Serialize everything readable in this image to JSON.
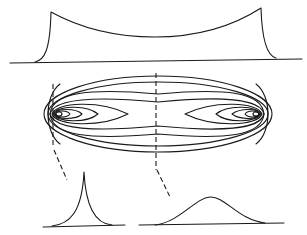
{
  "diagram": {
    "type": "contour-with-profiles",
    "colors": {
      "ink": "#1a1a1a",
      "background": "#ffffff"
    },
    "panels": [
      {
        "id": "top-profile",
        "description": "Longitudinal profile: sharp peaks at both ends, shallow trough in middle"
      },
      {
        "id": "contour-map",
        "description": "Elongated elliptical family of nested closed contours with two foci near left and right ends"
      },
      {
        "id": "bottom-left-profile",
        "description": "Cross-section near the end: sharp cusp-shaped peak"
      },
      {
        "id": "bottom-right-profile",
        "description": "Cross-section through center: broad bell-shaped peak"
      }
    ],
    "section_lines": [
      {
        "id": "end-section",
        "x": 53,
        "connects": "bottom-left-profile"
      },
      {
        "id": "center-section",
        "x": 156,
        "connects": "bottom-right-profile"
      }
    ]
  }
}
